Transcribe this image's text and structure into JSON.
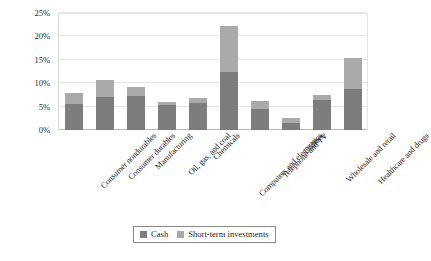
{
  "chart_data": {
    "type": "bar",
    "stacked": true,
    "title": "",
    "subtitle": "",
    "xlabel": "",
    "ylabel": "",
    "ylim": [
      0,
      25
    ],
    "ytick_labels": [
      "0%",
      "5%",
      "10%",
      "15%",
      "20%",
      "25%"
    ],
    "ytick_values": [
      0,
      5,
      10,
      15,
      20,
      25
    ],
    "grid": true,
    "grid_axis": "y",
    "legend_position": "bottom-center",
    "categories": [
      "Consumer nondurables",
      "Consumer durables",
      "Manufacturing",
      "Oil, gas, and coal",
      "Chemicals",
      "Computers and electronics",
      "Telephone and TV",
      "Utilities",
      "Wholesale and retail",
      "Healthcare and drugs"
    ],
    "series": [
      {
        "name": "Cash",
        "color": "#7d7d7d",
        "values": [
          5.6,
          7.1,
          7.3,
          5.4,
          5.7,
          12.5,
          4.4,
          1.6,
          6.4,
          8.8
        ]
      },
      {
        "name": "Short-term investments",
        "color": "#aaaaaa",
        "values": [
          2.3,
          3.6,
          1.8,
          0.5,
          1.1,
          9.8,
          1.9,
          0.9,
          1.1,
          6.6
        ]
      }
    ],
    "totals": [
      7.9,
      10.7,
      9.1,
      5.9,
      6.8,
      22.3,
      6.3,
      2.5,
      7.5,
      15.4
    ]
  },
  "legend": {
    "items": [
      {
        "label": "Cash",
        "color": "#7d7d7d"
      },
      {
        "label": "Short-term investments",
        "color": "#aaaaaa"
      }
    ]
  },
  "colors": {
    "cash": "#7d7d7d",
    "short_term_investments": "#aaaaaa",
    "gridline": "#e6e6e6",
    "axis": "#b9b9b9",
    "background": "#ffffff"
  }
}
